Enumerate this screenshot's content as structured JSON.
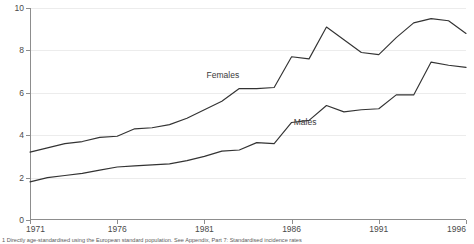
{
  "chart_data": {
    "type": "line",
    "title": "",
    "subtitle": "",
    "xlabel": "",
    "ylabel": "",
    "xlim": [
      1971,
      1996
    ],
    "ylim": [
      0,
      10
    ],
    "grid": true,
    "legend_position": "inline-annotation",
    "x_tick_labels": [
      "1971",
      "1976",
      "1981",
      "1986",
      "1991",
      "1996"
    ],
    "x_ticks": [
      1971,
      1976,
      1981,
      1986,
      1991,
      1996
    ],
    "y_tick_labels": [
      "0",
      "2",
      "4",
      "6",
      "8",
      "10"
    ],
    "y_ticks": [
      0,
      2,
      4,
      6,
      8,
      10
    ],
    "x": [
      1971,
      1972,
      1973,
      1974,
      1975,
      1976,
      1977,
      1978,
      1979,
      1980,
      1981,
      1982,
      1983,
      1984,
      1985,
      1986,
      1987,
      1988,
      1989,
      1990,
      1991,
      1992,
      1993,
      1994,
      1995,
      1996
    ],
    "series": [
      {
        "name": "Females",
        "color": "#333333",
        "values": [
          3.2,
          3.4,
          3.6,
          3.7,
          3.9,
          3.95,
          4.3,
          4.35,
          4.5,
          4.8,
          5.2,
          5.6,
          6.2,
          6.2,
          6.25,
          7.7,
          7.6,
          9.1,
          8.5,
          7.9,
          7.8,
          8.6,
          9.3,
          9.5,
          9.4,
          8.8
        ]
      },
      {
        "name": "Males",
        "color": "#333333",
        "values": [
          1.8,
          2.0,
          2.1,
          2.2,
          2.35,
          2.5,
          2.55,
          2.6,
          2.65,
          2.8,
          3.0,
          3.25,
          3.3,
          3.65,
          3.6,
          4.6,
          4.7,
          5.4,
          5.1,
          5.2,
          5.25,
          5.9,
          5.9,
          7.45,
          7.3,
          7.2
        ]
      }
    ],
    "annotations": [
      {
        "text": "Females",
        "x_frac": 0.405,
        "y_frac": 0.295
      },
      {
        "text": "Males",
        "x_frac": 0.605,
        "y_frac": 0.517
      }
    ]
  },
  "footnote": {
    "text": "1 Directly age-standardised using the European standard population. See Appendix, Part 7: Standardised incidence rates"
  }
}
